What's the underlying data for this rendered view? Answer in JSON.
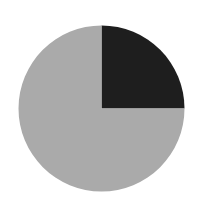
{
  "chart_data": {
    "type": "pie",
    "title": "",
    "categories": [
      "Slice A",
      "Slice B"
    ],
    "values": [
      25,
      75
    ],
    "colors": [
      "#1e1e1e",
      "#aaaaaa"
    ],
    "start_angle_deg": 90,
    "direction": "clockwise",
    "legend": null,
    "labels_shown": false
  },
  "layout": {
    "cx": 101.5,
    "cy": 108.5,
    "r": 83,
    "background": "#ffffff"
  }
}
